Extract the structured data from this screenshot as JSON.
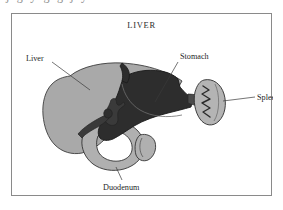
{
  "page": {
    "background_color": "#ffffff",
    "width": 283,
    "height": 210
  },
  "scan_artifact": {
    "clipped_text_above": "j g y g g j y"
  },
  "figure": {
    "title": "LIVER",
    "frame_color": "#8a8a8a",
    "background_color": "#ffffff"
  },
  "labels": {
    "liver": "Liver",
    "stomach": "Stomach",
    "spleen": "Spleen",
    "duodenum": "Duodenum"
  },
  "colors": {
    "liver_fill": "#a9a9a9",
    "liver_stroke": "#3d3d3d",
    "stomach_fill": "#2d2d2d",
    "stomach_stroke": "#1a1a1a",
    "spleen_fill": "#b4b4b4",
    "spleen_stroke": "#2f2f2f",
    "duodenum_fill": "#b0b0b0",
    "duodenum_stroke": "#333333",
    "duct_fill": "#3a3a3a",
    "text": "#262626",
    "leader": "#3a3a3a"
  },
  "diagram": {
    "type": "anatomical-illustration",
    "subject": "liver",
    "organs": [
      "liver",
      "stomach",
      "spleen",
      "duodenum"
    ]
  }
}
